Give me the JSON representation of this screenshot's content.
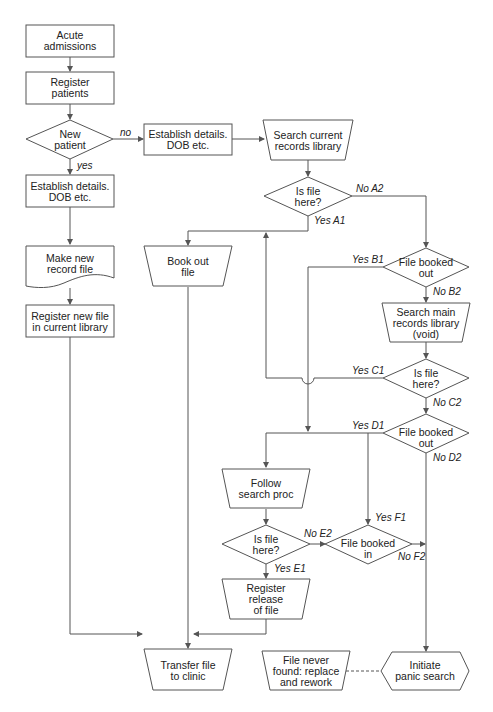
{
  "nodes": {
    "acute_admissions": [
      "Acute",
      "admissions"
    ],
    "register_patients": [
      "Register",
      "patients"
    ],
    "new_patient": [
      "New",
      "patient"
    ],
    "establish_details_left": [
      "Establish details.",
      "DOB etc."
    ],
    "establish_details_top": [
      "Establish details.",
      "DOB etc."
    ],
    "search_current": [
      "Search current",
      "records library"
    ],
    "is_file_here_a": [
      "Is file",
      "here?"
    ],
    "make_new_record": [
      "Make new",
      "record file"
    ],
    "book_out_file": [
      "Book out",
      "file"
    ],
    "file_booked_out_b": [
      "File booked",
      "out"
    ],
    "register_new_file": [
      "Register new file",
      "in current library"
    ],
    "search_main": [
      "Search main",
      "records library",
      "(void)"
    ],
    "is_file_here_c": [
      "Is file",
      "here?"
    ],
    "file_booked_out_d": [
      "File booked",
      "out"
    ],
    "follow_search": [
      "Follow",
      "search proc"
    ],
    "is_file_here_e": [
      "Is file",
      "here?"
    ],
    "file_booked_in": [
      "File booked",
      "in"
    ],
    "register_release": [
      "Register",
      "release",
      "of file"
    ],
    "transfer_file": [
      "Transfer file",
      "to clinic"
    ],
    "file_never_found": [
      "File never",
      "found: replace",
      "and rework"
    ],
    "initiate_panic": [
      "Initiate",
      "panic search"
    ]
  },
  "edges": {
    "no": "no",
    "yes": "yes",
    "no_a2": "No A2",
    "yes_a1": "Yes A1",
    "yes_b1": "Yes B1",
    "no_b2": "No B2",
    "yes_c1": "Yes C1",
    "no_c2": "No C2",
    "yes_d1": "Yes D1",
    "no_d2": "No D2",
    "yes_f1": "Yes F1",
    "no_e2": "No E2",
    "no_f2": "No F2",
    "yes_e1": "Yes E1"
  },
  "colors": {
    "stroke": "#555555",
    "text": "#222222",
    "background": "#ffffff"
  }
}
